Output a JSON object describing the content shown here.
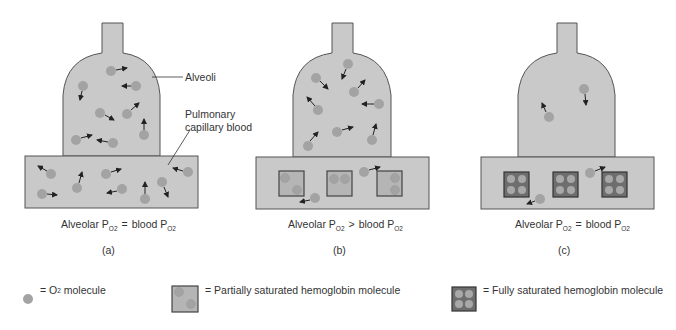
{
  "panels": [
    {
      "id": "a",
      "letter": "(a)",
      "caption_left": "Alveolar P",
      "operator": "=",
      "caption_right": "blood P",
      "subscript": "O2"
    },
    {
      "id": "b",
      "letter": "(b)",
      "caption_left": "Alveolar P",
      "operator": ">",
      "caption_right": "blood P",
      "subscript": "O2"
    },
    {
      "id": "c",
      "letter": "(c)",
      "caption_left": "Alveolar P",
      "operator": "=",
      "caption_right": "blood P",
      "subscript": "O2"
    }
  ],
  "labels": {
    "alveoli": "Alveoli",
    "capillary_line1": "Pulmonary",
    "capillary_line2": "capillary blood"
  },
  "legend": {
    "o2": {
      "eq": "=",
      "text_pre": "O",
      "sub": "2",
      "text_post": " molecule"
    },
    "partial": {
      "eq": "=",
      "text": "Partially saturated hemoglobin molecule"
    },
    "full": {
      "eq": "=",
      "text": "Fully saturated hemoglobin molecule"
    }
  },
  "colors": {
    "fill": "#c9c9c9",
    "stroke": "#555555",
    "molecule": "#a3a3a3",
    "hb_partial": "#b5b5b5",
    "hb_full": "#6e6e6e",
    "arrow": "#222222"
  }
}
